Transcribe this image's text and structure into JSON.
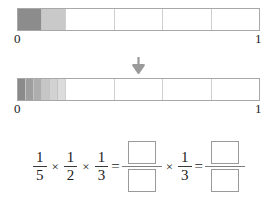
{
  "model": {
    "axis_start_label": "0",
    "axis_end_label": "1",
    "arrow_icon": "arrow-down-icon",
    "bars": [
      {
        "id": "bar-1",
        "total_parts": 5,
        "description": "one fifth split in half, first half fully shaded",
        "segments_in_first_fifth": [
          {
            "fill": "#8c8c8c"
          },
          {
            "fill": "#c9c9c9"
          }
        ]
      },
      {
        "id": "bar-2",
        "total_parts": 5,
        "description": "one fifth split into sixths with graduated shading",
        "segments_in_first_fifth": [
          {
            "fill": "#8a8a8a"
          },
          {
            "fill": "#9e9e9e"
          },
          {
            "fill": "#aeaeae"
          },
          {
            "fill": "#c6c6c6"
          },
          {
            "fill": "#d2d2d2"
          },
          {
            "fill": "#dcdcdc"
          }
        ]
      }
    ]
  },
  "equation": {
    "term1": {
      "numerator": "1",
      "denominator": "5"
    },
    "op1": "×",
    "term2": {
      "numerator": "1",
      "denominator": "2"
    },
    "op2": "×",
    "term3": {
      "numerator": "1",
      "denominator": "3"
    },
    "equals1": "=",
    "answer1": {
      "numerator": "",
      "denominator": ""
    },
    "op3": "×",
    "term4": {
      "numerator": "1",
      "denominator": "3"
    },
    "equals2": "=",
    "answer2": {
      "numerator": "",
      "denominator": ""
    }
  },
  "colors": {
    "bar_border": "#a8a8a8",
    "divider": "#cfcfcf",
    "text": "#1b1b1b",
    "arrow": "#9a9a9a",
    "answer_box_border": "#9a9a9a"
  }
}
